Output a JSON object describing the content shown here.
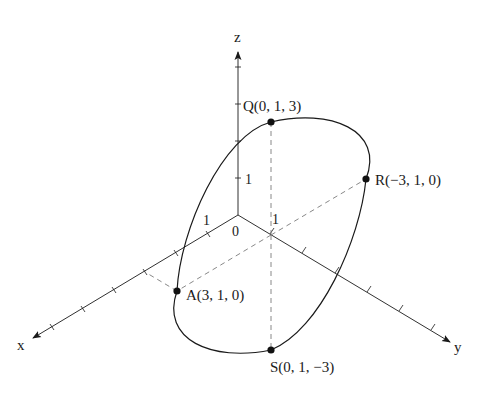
{
  "diagram": {
    "type": "3d-coordinate-ellipse",
    "colors": {
      "stroke": "#1a1a1a",
      "dashed": "#7a7a7a",
      "background": "#ffffff"
    },
    "axes": {
      "x": {
        "label": "x"
      },
      "y": {
        "label": "y"
      },
      "z": {
        "label": "z"
      }
    },
    "origin_label": "0",
    "unit_labels": {
      "x": "1",
      "y": "1",
      "z": "1"
    },
    "points": [
      {
        "id": "Q",
        "label": "Q(0, 1, 3)",
        "coords": [
          0,
          1,
          3
        ]
      },
      {
        "id": "R",
        "label": "R(−3, 1, 0)",
        "coords": [
          -3,
          1,
          0
        ]
      },
      {
        "id": "A",
        "label": "A(3, 1, 0)",
        "coords": [
          3,
          1,
          0
        ]
      },
      {
        "id": "S",
        "label": "S(0, 1, −3)",
        "coords": [
          0,
          1,
          -3
        ]
      }
    ],
    "curve": "circle of radius 3 in plane y = 1 centered at (0, 1, 0)"
  }
}
